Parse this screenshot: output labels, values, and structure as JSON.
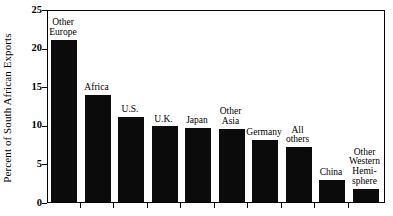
{
  "chart_data": {
    "type": "bar",
    "title": "",
    "xlabel": "",
    "ylabel": "Percent of South African Exports",
    "ylim": [
      0,
      25
    ],
    "ytick_labels": [
      "0",
      "5",
      "10",
      "15",
      "20",
      "25"
    ],
    "ytick_values": [
      0,
      5,
      10,
      15,
      20,
      25
    ],
    "grid": false,
    "legend": "none",
    "bar_color": "#0b0b0b",
    "categories": [
      "Other\nEurope",
      "Africa",
      "U.S.",
      "U.K.",
      "Japan",
      "Other\nAsia",
      "Germany",
      "All\nothers",
      "China",
      "Other\nWestern\nHemi-\nsphere"
    ],
    "values": [
      21.0,
      13.9,
      11.0,
      9.8,
      9.6,
      9.5,
      8.0,
      7.1,
      2.9,
      1.7
    ]
  }
}
